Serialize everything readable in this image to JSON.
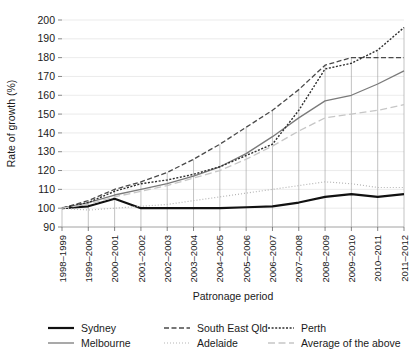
{
  "chart_data": {
    "type": "line",
    "title": "",
    "xlabel": "Patronage period",
    "ylabel": "Rate of growth (%)",
    "ylim": [
      90,
      200
    ],
    "yticks": [
      90,
      100,
      110,
      120,
      130,
      140,
      150,
      160,
      170,
      180,
      190,
      200
    ],
    "grid": true,
    "legend_position": "bottom",
    "categories": [
      "1998–1999",
      "1999–2000",
      "2000–2001",
      "2001–2002",
      "2002–2003",
      "2003–2004",
      "2004–2005",
      "2005–2006",
      "2006–2007",
      "2007–2008",
      "2008–2009",
      "2009–2010",
      "2010–2011",
      "2011–2012"
    ],
    "series": [
      {
        "name": "Sydney",
        "style": "solid",
        "color": "#111111",
        "width": 2.2,
        "values": [
          100,
          101,
          105,
          100,
          100,
          100,
          100,
          100.5,
          101,
          103,
          106,
          107.5,
          106,
          107.5
        ]
      },
      {
        "name": "Melbourne",
        "style": "solid",
        "color": "#7a7a7a",
        "width": 1.3,
        "values": [
          100,
          103,
          107,
          110,
          113,
          117,
          122,
          129,
          138,
          148,
          157,
          160,
          166,
          173
        ]
      },
      {
        "name": "South East Qld",
        "style": "dashed",
        "color": "#4a4a4a",
        "width": 1.3,
        "values": [
          100,
          104,
          110,
          114,
          119,
          126,
          134,
          143,
          152,
          163,
          176,
          180,
          180,
          180
        ]
      },
      {
        "name": "Adelaide",
        "style": "fine-dotted",
        "color": "#b5b5b5",
        "width": 1.2,
        "values": [
          100,
          99,
          100,
          101,
          102,
          104,
          106,
          108,
          110,
          112,
          114,
          113,
          111,
          111
        ]
      },
      {
        "name": "Perth",
        "style": "dotted",
        "color": "#2e2e2e",
        "width": 1.4,
        "values": [
          100,
          103,
          109,
          113,
          115,
          118,
          122,
          128,
          134,
          152,
          174,
          177,
          184,
          196
        ]
      },
      {
        "name": "Average of the above",
        "style": "long-dashed",
        "color": "#c6c6c6",
        "width": 1.3,
        "values": [
          100,
          102,
          106,
          109,
          112,
          116,
          120,
          126,
          133,
          141,
          148,
          150,
          152,
          155
        ]
      }
    ]
  },
  "legend": {
    "items": [
      {
        "label": "Sydney",
        "swatch": "solid-black-thick"
      },
      {
        "label": "South East Qld",
        "swatch": "dashed-dark"
      },
      {
        "label": "Perth",
        "swatch": "dotted-dark"
      },
      {
        "label": "Melbourne",
        "swatch": "solid-gray"
      },
      {
        "label": "Adelaide",
        "swatch": "fine-dotted-light"
      },
      {
        "label": "Average of the above",
        "swatch": "long-dashed-light"
      }
    ]
  }
}
